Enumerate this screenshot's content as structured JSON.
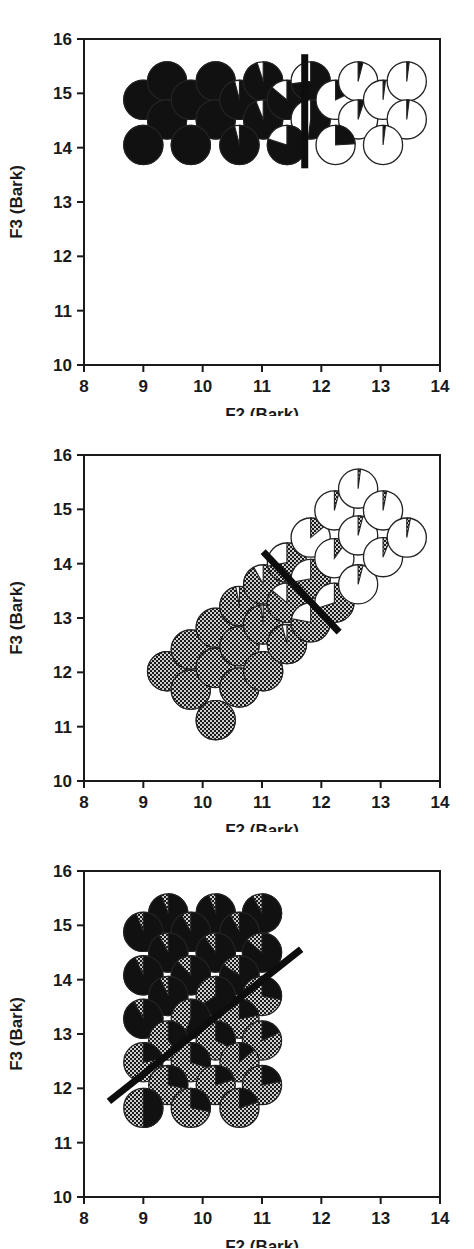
{
  "figure": {
    "type": "multi-panel-scatter",
    "panel_count": 3,
    "glyph": "pie-chart-marker"
  },
  "axes": {
    "xlabel": "F2 (Bark)",
    "ylabel": "F3 (Bark)",
    "xlim": [
      8,
      14
    ],
    "ylim": [
      10,
      16
    ],
    "xticks": [
      8,
      9,
      10,
      11,
      12,
      13,
      14
    ],
    "yticks": [
      10,
      11,
      12,
      13,
      14,
      15,
      16
    ],
    "xtick_labels": [
      "8",
      "9",
      "10",
      "11",
      "12",
      "13",
      "14"
    ],
    "ytick_labels": [
      "10",
      "11",
      "12",
      "13",
      "14",
      "15",
      "16"
    ],
    "grid": false,
    "frame": true,
    "tick_direction": "out"
  },
  "style": {
    "black": "#111111",
    "white": "#ffffff",
    "stipple_fg": "#1a1a1a",
    "stipple_bg": "#cfcfcf",
    "outline": "#222222",
    "axis_color": "#1a1a1a",
    "boundary_color": "#0d0d0d",
    "marker_radius_bark": 0.33,
    "boundary_width_px": 7
  },
  "chart_data": [
    {
      "type": "scatter",
      "id": "panel-1",
      "title": "",
      "xlabel": "F2 (Bark)",
      "ylabel": "F3 (Bark)",
      "xlim": [
        8,
        14
      ],
      "ylim": [
        10,
        16
      ],
      "fill_a": "black",
      "fill_b": "white",
      "boundary": {
        "x1": 11.72,
        "y1": 15.72,
        "x2": 11.72,
        "y2": 13.62
      },
      "points": [
        {
          "x": 9.0,
          "y": 14.88,
          "frac_a": 1.0
        },
        {
          "x": 9.4,
          "y": 15.22,
          "frac_a": 1.0
        },
        {
          "x": 9.4,
          "y": 14.52,
          "frac_a": 1.0
        },
        {
          "x": 9.0,
          "y": 14.05,
          "frac_a": 1.0
        },
        {
          "x": 9.8,
          "y": 14.88,
          "frac_a": 1.0
        },
        {
          "x": 10.22,
          "y": 15.22,
          "frac_a": 1.0
        },
        {
          "x": 10.22,
          "y": 14.52,
          "frac_a": 1.0
        },
        {
          "x": 9.8,
          "y": 14.05,
          "frac_a": 1.0
        },
        {
          "x": 10.62,
          "y": 14.88,
          "frac_a": 0.96
        },
        {
          "x": 11.02,
          "y": 15.22,
          "frac_a": 0.95
        },
        {
          "x": 11.02,
          "y": 14.52,
          "frac_a": 0.94
        },
        {
          "x": 10.62,
          "y": 14.05,
          "frac_a": 0.96
        },
        {
          "x": 11.42,
          "y": 14.88,
          "frac_a": 0.86
        },
        {
          "x": 11.82,
          "y": 15.22,
          "frac_a": 0.73
        },
        {
          "x": 11.82,
          "y": 14.52,
          "frac_a": 0.52
        },
        {
          "x": 11.42,
          "y": 14.05,
          "frac_a": 0.8
        },
        {
          "x": 12.24,
          "y": 14.88,
          "frac_a": 0.18
        },
        {
          "x": 12.62,
          "y": 15.22,
          "frac_a": 0.04
        },
        {
          "x": 12.62,
          "y": 14.52,
          "frac_a": 0.05
        },
        {
          "x": 12.24,
          "y": 14.05,
          "frac_a": 0.24
        },
        {
          "x": 13.04,
          "y": 14.88,
          "frac_a": 0.02
        },
        {
          "x": 13.44,
          "y": 15.22,
          "frac_a": 0.02
        },
        {
          "x": 13.44,
          "y": 14.52,
          "frac_a": 0.02
        },
        {
          "x": 13.04,
          "y": 14.05,
          "frac_a": 0.02
        }
      ]
    },
    {
      "type": "scatter",
      "id": "panel-2",
      "title": "",
      "xlabel": "F2 (Bark)",
      "ylabel": "F3 (Bark)",
      "xlim": [
        8,
        14
      ],
      "ylim": [
        10,
        16
      ],
      "fill_a": "stipple",
      "fill_b": "white",
      "boundary": {
        "x1": 11.02,
        "y1": 14.22,
        "x2": 12.3,
        "y2": 12.74
      },
      "points": [
        {
          "x": 9.4,
          "y": 12.02,
          "frac_a": 1.0
        },
        {
          "x": 9.8,
          "y": 12.42,
          "frac_a": 1.0
        },
        {
          "x": 9.8,
          "y": 11.68,
          "frac_a": 1.0
        },
        {
          "x": 10.22,
          "y": 12.82,
          "frac_a": 1.0
        },
        {
          "x": 10.22,
          "y": 12.08,
          "frac_a": 1.0
        },
        {
          "x": 10.22,
          "y": 11.12,
          "frac_a": 1.0
        },
        {
          "x": 10.62,
          "y": 13.22,
          "frac_a": 0.97
        },
        {
          "x": 10.62,
          "y": 12.48,
          "frac_a": 1.0
        },
        {
          "x": 10.62,
          "y": 11.72,
          "frac_a": 1.0
        },
        {
          "x": 11.02,
          "y": 13.62,
          "frac_a": 0.92
        },
        {
          "x": 11.02,
          "y": 12.88,
          "frac_a": 0.98
        },
        {
          "x": 11.02,
          "y": 12.02,
          "frac_a": 1.0
        },
        {
          "x": 11.42,
          "y": 14.02,
          "frac_a": 0.72
        },
        {
          "x": 11.42,
          "y": 13.28,
          "frac_a": 0.86
        },
        {
          "x": 11.42,
          "y": 12.52,
          "frac_a": 0.96
        },
        {
          "x": 11.82,
          "y": 14.48,
          "frac_a": 0.14
        },
        {
          "x": 11.82,
          "y": 13.72,
          "frac_a": 0.72
        },
        {
          "x": 11.82,
          "y": 12.92,
          "frac_a": 0.78
        },
        {
          "x": 12.22,
          "y": 14.98,
          "frac_a": 0.04
        },
        {
          "x": 12.22,
          "y": 14.1,
          "frac_a": 0.1
        },
        {
          "x": 12.22,
          "y": 13.28,
          "frac_a": 0.7
        },
        {
          "x": 12.62,
          "y": 15.38,
          "frac_a": 0.02
        },
        {
          "x": 12.62,
          "y": 14.52,
          "frac_a": 0.04
        },
        {
          "x": 12.62,
          "y": 13.62,
          "frac_a": 0.04
        },
        {
          "x": 13.04,
          "y": 14.98,
          "frac_a": 0.03
        },
        {
          "x": 13.04,
          "y": 14.12,
          "frac_a": 0.06
        },
        {
          "x": 13.44,
          "y": 14.48,
          "frac_a": 0.03
        }
      ]
    },
    {
      "type": "scatter",
      "id": "panel-3",
      "title": "",
      "xlabel": "F2 (Bark)",
      "ylabel": "F3 (Bark)",
      "xlim": [
        8,
        14
      ],
      "ylim": [
        10,
        16
      ],
      "fill_a": "black",
      "fill_b": "stipple",
      "boundary": {
        "x1": 8.42,
        "y1": 11.76,
        "x2": 11.66,
        "y2": 14.56
      },
      "points": [
        {
          "x": 9.42,
          "y": 15.22,
          "frac_a": 0.94
        },
        {
          "x": 10.22,
          "y": 15.22,
          "frac_a": 0.94
        },
        {
          "x": 11.0,
          "y": 15.22,
          "frac_a": 0.92
        },
        {
          "x": 9.0,
          "y": 14.88,
          "frac_a": 0.94
        },
        {
          "x": 9.8,
          "y": 14.88,
          "frac_a": 0.92
        },
        {
          "x": 10.62,
          "y": 14.88,
          "frac_a": 0.92
        },
        {
          "x": 9.42,
          "y": 14.5,
          "frac_a": 0.92
        },
        {
          "x": 10.22,
          "y": 14.5,
          "frac_a": 0.9
        },
        {
          "x": 11.0,
          "y": 14.5,
          "frac_a": 0.86
        },
        {
          "x": 9.0,
          "y": 14.08,
          "frac_a": 0.93
        },
        {
          "x": 9.8,
          "y": 14.08,
          "frac_a": 0.88
        },
        {
          "x": 10.62,
          "y": 14.08,
          "frac_a": 0.84
        },
        {
          "x": 9.42,
          "y": 13.7,
          "frac_a": 0.93
        },
        {
          "x": 10.22,
          "y": 13.7,
          "frac_a": 0.66
        },
        {
          "x": 11.0,
          "y": 13.7,
          "frac_a": 0.28
        },
        {
          "x": 9.0,
          "y": 13.28,
          "frac_a": 0.92
        },
        {
          "x": 9.8,
          "y": 13.28,
          "frac_a": 0.56
        },
        {
          "x": 10.62,
          "y": 13.28,
          "frac_a": 0.22
        },
        {
          "x": 9.42,
          "y": 12.88,
          "frac_a": 0.4
        },
        {
          "x": 10.22,
          "y": 12.88,
          "frac_a": 0.32
        },
        {
          "x": 11.0,
          "y": 12.88,
          "frac_a": 0.18
        },
        {
          "x": 9.0,
          "y": 12.48,
          "frac_a": 0.22
        },
        {
          "x": 9.8,
          "y": 12.48,
          "frac_a": 0.3
        },
        {
          "x": 10.62,
          "y": 12.48,
          "frac_a": 0.14
        },
        {
          "x": 9.42,
          "y": 12.06,
          "frac_a": 0.28
        },
        {
          "x": 10.22,
          "y": 12.06,
          "frac_a": 0.2
        },
        {
          "x": 11.0,
          "y": 12.06,
          "frac_a": 0.22
        },
        {
          "x": 9.0,
          "y": 11.64,
          "frac_a": 0.5
        },
        {
          "x": 9.8,
          "y": 11.64,
          "frac_a": 0.28
        },
        {
          "x": 10.62,
          "y": 11.64,
          "frac_a": 0.2
        }
      ]
    }
  ]
}
